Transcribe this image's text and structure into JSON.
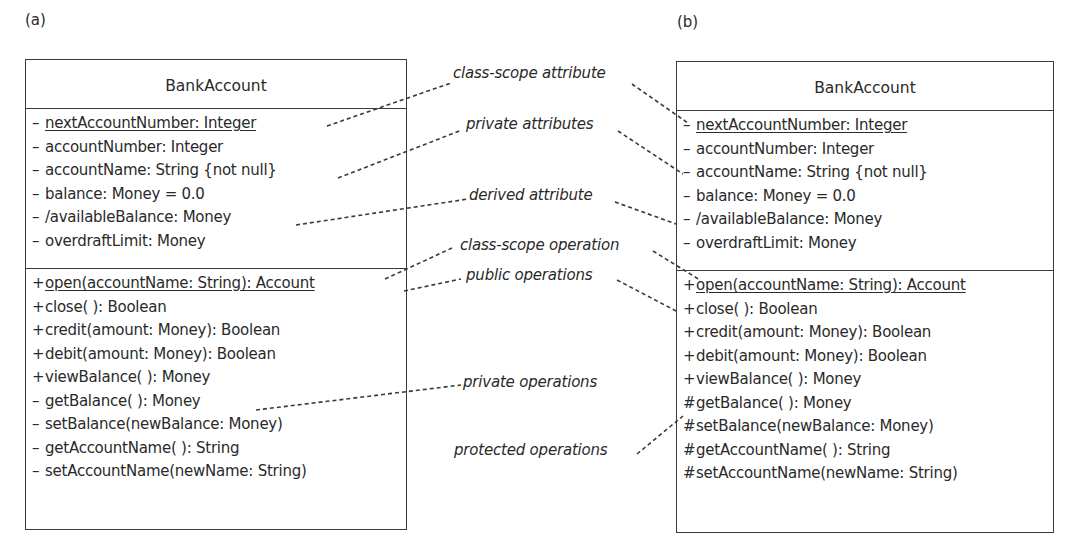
{
  "panels": [
    {
      "label": "(a)",
      "class_name": "BankAccount",
      "attributes": [
        {
          "vis": "–",
          "text": "nextAccountNumber: Integer",
          "static": true
        },
        {
          "vis": "–",
          "text": "accountNumber: Integer",
          "static": false
        },
        {
          "vis": "–",
          "text": "accountName: String {not null}",
          "static": false
        },
        {
          "vis": "–",
          "text": "balance: Money = 0.0",
          "static": false
        },
        {
          "vis": "–",
          "text": "/availableBalance: Money",
          "static": false
        },
        {
          "vis": "–",
          "text": "overdraftLimit: Money",
          "static": false
        }
      ],
      "operations": [
        {
          "vis": "+",
          "text": "open(accountName: String): Account",
          "static": true
        },
        {
          "vis": "+",
          "text": "close( ): Boolean",
          "static": false
        },
        {
          "vis": "+",
          "text": "credit(amount: Money): Boolean",
          "static": false
        },
        {
          "vis": "+",
          "text": "debit(amount: Money): Boolean",
          "static": false
        },
        {
          "vis": "+",
          "text": "viewBalance( ): Money",
          "static": false
        },
        {
          "vis": "–",
          "text": "getBalance( ): Money",
          "static": false
        },
        {
          "vis": "–",
          "text": "setBalance(newBalance: Money)",
          "static": false
        },
        {
          "vis": "–",
          "text": "getAccountName( ): String",
          "static": false
        },
        {
          "vis": "–",
          "text": "setAccountName(newName: String)",
          "static": false
        }
      ]
    },
    {
      "label": "(b)",
      "class_name": "BankAccount",
      "attributes": [
        {
          "vis": "–",
          "text": "nextAccountNumber: Integer",
          "static": true
        },
        {
          "vis": "–",
          "text": "accountNumber: Integer",
          "static": false
        },
        {
          "vis": "–",
          "text": "accountName: String {not null}",
          "static": false
        },
        {
          "vis": "–",
          "text": "balance: Money = 0.0",
          "static": false
        },
        {
          "vis": "–",
          "text": "/availableBalance: Money",
          "static": false
        },
        {
          "vis": "–",
          "text": "overdraftLimit: Money",
          "static": false
        }
      ],
      "operations": [
        {
          "vis": "+",
          "text": "open(accountName: String): Account",
          "static": true
        },
        {
          "vis": "+",
          "text": "close( ): Boolean",
          "static": false
        },
        {
          "vis": "+",
          "text": "credit(amount: Money): Boolean",
          "static": false
        },
        {
          "vis": "+",
          "text": "debit(amount: Money): Boolean",
          "static": false
        },
        {
          "vis": "+",
          "text": "viewBalance( ): Money",
          "static": false
        },
        {
          "vis": "#",
          "text": "getBalance( ): Money",
          "static": false
        },
        {
          "vis": "#",
          "text": "setBalance(newBalance: Money)",
          "static": false
        },
        {
          "vis": "#",
          "text": "getAccountName( ): String",
          "static": false
        },
        {
          "vis": "#",
          "text": "setAccountName(newName: String)",
          "static": false
        }
      ]
    }
  ],
  "annotations": {
    "class_scope_attribute": "class-scope attribute",
    "private_attributes": "private attributes",
    "derived_attribute": "derived attribute",
    "class_scope_operation": "class-scope operation",
    "public_operations": "public operations",
    "private_operations": "private operations",
    "protected_operations": "protected operations"
  },
  "colors": {
    "line": "#3a3a3a",
    "text": "#2a2a2a",
    "background": "#ffffff"
  }
}
